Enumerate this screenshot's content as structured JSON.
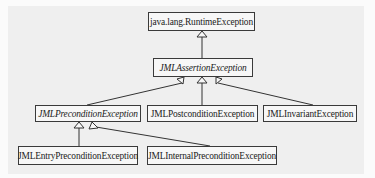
{
  "diagram": {
    "type": "uml-class-hierarchy",
    "nodes": [
      {
        "id": "runtime",
        "label": "java.lang.RuntimeException",
        "abstract": false
      },
      {
        "id": "assertion",
        "label": "JMLAssertionException",
        "abstract": true
      },
      {
        "id": "precondition",
        "label": "JMLPreconditionException",
        "abstract": true
      },
      {
        "id": "postcondition",
        "label": "JMLPostconditionException",
        "abstract": false
      },
      {
        "id": "invariant",
        "label": "JMLInvariantException",
        "abstract": false
      },
      {
        "id": "entry",
        "label": "JMLEntryPreconditionException",
        "abstract": false
      },
      {
        "id": "internal",
        "label": "JMLInternalPreconditionException",
        "abstract": false
      }
    ],
    "edges": [
      {
        "from": "assertion",
        "to": "runtime",
        "kind": "generalization"
      },
      {
        "from": "precondition",
        "to": "assertion",
        "kind": "generalization"
      },
      {
        "from": "postcondition",
        "to": "assertion",
        "kind": "generalization"
      },
      {
        "from": "invariant",
        "to": "assertion",
        "kind": "generalization"
      },
      {
        "from": "entry",
        "to": "precondition",
        "kind": "generalization"
      },
      {
        "from": "internal",
        "to": "precondition",
        "kind": "generalization"
      }
    ],
    "colors": {
      "line": "#333333",
      "box_border": "#3a3a3a",
      "box_fill": "#f7f7f7",
      "background": "#efefef"
    }
  }
}
